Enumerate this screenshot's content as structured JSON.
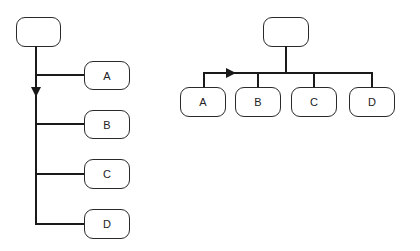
{
  "diagrams": [
    {
      "name": "vertical-tree",
      "root": {
        "label": ""
      },
      "children": [
        {
          "label": "A"
        },
        {
          "label": "B"
        },
        {
          "label": "C"
        },
        {
          "label": "D"
        }
      ],
      "orientation": "vertical",
      "arrow_direction": "down"
    },
    {
      "name": "horizontal-tree",
      "root": {
        "label": ""
      },
      "children": [
        {
          "label": "A"
        },
        {
          "label": "B"
        },
        {
          "label": "C"
        },
        {
          "label": "D"
        }
      ],
      "orientation": "horizontal",
      "arrow_direction": "right"
    }
  ],
  "colors": {
    "line": "#1a1a1a",
    "border": "#2a2a2a",
    "background": "#ffffff"
  }
}
